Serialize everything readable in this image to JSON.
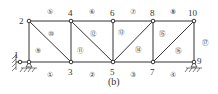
{
  "figure": {
    "caption": "(b)",
    "nodes": [
      {
        "id": "1",
        "x": 20,
        "y": 62,
        "label": "1"
      },
      {
        "id": "2",
        "x": 29,
        "y": 21,
        "label": "2"
      },
      {
        "id": "3",
        "x": 71,
        "y": 62,
        "label": "3"
      },
      {
        "id": "4",
        "x": 71,
        "y": 21,
        "label": "4"
      },
      {
        "id": "5",
        "x": 113,
        "y": 62,
        "label": "5"
      },
      {
        "id": "6",
        "x": 113,
        "y": 21,
        "label": "6"
      },
      {
        "id": "7",
        "x": 153,
        "y": 62,
        "label": "7"
      },
      {
        "id": "8",
        "x": 153,
        "y": 21,
        "label": "8"
      },
      {
        "id": "9",
        "x": 194,
        "y": 62,
        "label": "9"
      },
      {
        "id": "10",
        "x": 194,
        "y": 21,
        "label": "10"
      }
    ],
    "members": [
      {
        "id": "1",
        "label": "①"
      },
      {
        "id": "2",
        "label": "②"
      },
      {
        "id": "3",
        "label": "③"
      },
      {
        "id": "4",
        "label": "④"
      },
      {
        "id": "5",
        "label": "⑤"
      },
      {
        "id": "6",
        "label": "⑥"
      },
      {
        "id": "7",
        "label": "⑦"
      },
      {
        "id": "8",
        "label": "⑧"
      },
      {
        "id": "9",
        "label": "⑨"
      },
      {
        "id": "10",
        "label": "⑩"
      },
      {
        "id": "11",
        "label": "⑪"
      },
      {
        "id": "12",
        "label": "⑫"
      },
      {
        "id": "13",
        "label": "⑬"
      },
      {
        "id": "14",
        "label": "⑭"
      },
      {
        "id": "15",
        "label": "⑮"
      },
      {
        "id": "16",
        "label": "⑯"
      },
      {
        "id": "17",
        "label": "⑰"
      }
    ]
  }
}
